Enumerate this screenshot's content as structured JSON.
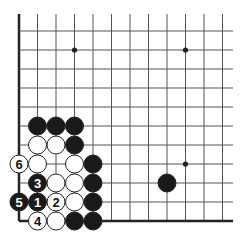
{
  "diagram": {
    "type": "go-board-corner",
    "corner": "bottom-left",
    "columns": 12,
    "rows": 11,
    "grid": {
      "origin_x": 19,
      "origin_y": 31,
      "spacing_x": 18.5,
      "spacing_y": 19,
      "line_top": 14,
      "line_right": 233,
      "left_edge": true,
      "bottom_edge": true
    },
    "colors": {
      "background": "#ffffff",
      "line": "#555555",
      "edge": "#222222",
      "black_stone": "#1a1a1a",
      "white_stone": "#ffffff",
      "stone_outline": "#222222"
    },
    "star_points": [
      {
        "col": 3,
        "row": 1
      },
      {
        "col": 9,
        "row": 1
      },
      {
        "col": 9,
        "row": 7
      }
    ],
    "stones": [
      {
        "col": 1,
        "row": 5,
        "color": "black",
        "label": ""
      },
      {
        "col": 2,
        "row": 5,
        "color": "black",
        "label": ""
      },
      {
        "col": 3,
        "row": 5,
        "color": "black",
        "label": ""
      },
      {
        "col": 1,
        "row": 6,
        "color": "white",
        "label": ""
      },
      {
        "col": 2,
        "row": 6,
        "color": "white",
        "label": ""
      },
      {
        "col": 3,
        "row": 6,
        "color": "black",
        "label": ""
      },
      {
        "col": 0,
        "row": 7,
        "color": "white",
        "label": "6"
      },
      {
        "col": 1,
        "row": 7,
        "color": "white",
        "label": ""
      },
      {
        "col": 3,
        "row": 7,
        "color": "white",
        "label": ""
      },
      {
        "col": 4,
        "row": 7,
        "color": "black",
        "label": ""
      },
      {
        "col": 1,
        "row": 8,
        "color": "black",
        "label": "3"
      },
      {
        "col": 2,
        "row": 8,
        "color": "white",
        "label": ""
      },
      {
        "col": 3,
        "row": 8,
        "color": "white",
        "label": ""
      },
      {
        "col": 4,
        "row": 8,
        "color": "black",
        "label": ""
      },
      {
        "col": 0,
        "row": 9,
        "color": "black",
        "label": "5"
      },
      {
        "col": 1,
        "row": 9,
        "color": "black",
        "label": "1"
      },
      {
        "col": 2,
        "row": 9,
        "color": "white",
        "label": "2"
      },
      {
        "col": 3,
        "row": 9,
        "color": "white",
        "label": ""
      },
      {
        "col": 4,
        "row": 9,
        "color": "black",
        "label": ""
      },
      {
        "col": 1,
        "row": 10,
        "color": "white",
        "label": "4"
      },
      {
        "col": 2,
        "row": 10,
        "color": "white",
        "label": ""
      },
      {
        "col": 3,
        "row": 10,
        "color": "black",
        "label": ""
      },
      {
        "col": 4,
        "row": 10,
        "color": "black",
        "label": ""
      },
      {
        "col": 8,
        "row": 8,
        "color": "black",
        "label": ""
      }
    ]
  }
}
